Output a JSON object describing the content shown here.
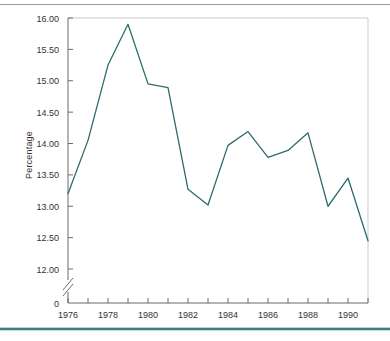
{
  "figure": {
    "background_color": "#ffffff",
    "top_rule_color": "#9a9a9a",
    "bottom_rule_color": "#3d7f7f",
    "frame_color": "#c9c9c9"
  },
  "chart_data": {
    "type": "line",
    "title": "",
    "xlabel": "",
    "ylabel": "Percentage",
    "x": [
      1976,
      1977,
      1978,
      1979,
      1980,
      1981,
      1982,
      1983,
      1984,
      1985,
      1986,
      1987,
      1988,
      1989,
      1990,
      1991
    ],
    "values": [
      13.2,
      14.05,
      15.25,
      15.9,
      14.95,
      14.89,
      13.27,
      13.02,
      13.97,
      14.19,
      13.78,
      13.89,
      14.17,
      13.0,
      13.45,
      12.45
    ],
    "series": [
      {
        "name": "Percentage",
        "color": "#2e6b6b",
        "values": [
          13.2,
          14.05,
          15.25,
          15.9,
          14.95,
          14.89,
          13.27,
          13.02,
          13.97,
          14.19,
          13.78,
          13.89,
          14.17,
          13.0,
          13.45,
          12.45
        ]
      }
    ],
    "ylim": [
      12.0,
      16.0
    ],
    "xlim": [
      1976,
      1991
    ],
    "ytick_labels": [
      "16.00",
      "15.50",
      "15.00",
      "14.50",
      "14.00",
      "13.50",
      "13.00",
      "12.50",
      "12.00",
      "0"
    ],
    "ytick_values": [
      16.0,
      15.5,
      15.0,
      14.5,
      14.0,
      13.5,
      13.0,
      12.5,
      12.0,
      0
    ],
    "xtick_labels": [
      "1976",
      "1978",
      "1980",
      "1982",
      "1984",
      "1986",
      "1988",
      "1990"
    ],
    "xtick_values": [
      1976,
      1978,
      1980,
      1982,
      1984,
      1986,
      1988,
      1990
    ],
    "xtick_minor_values": [
      1977,
      1979,
      1981,
      1983,
      1985,
      1987,
      1989,
      1991
    ],
    "axis_break": true,
    "axis_break_label": "0",
    "grid": false,
    "legend": "none"
  }
}
